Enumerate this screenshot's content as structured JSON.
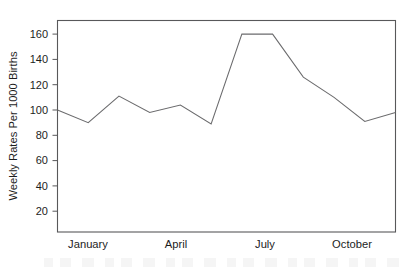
{
  "chart_data": {
    "type": "line",
    "title": "",
    "subtitle": "",
    "xlabel": "",
    "ylabel": "Weekly Rates Per 1000 Births",
    "categories": [
      "January",
      "February",
      "March",
      "April",
      "May",
      "June",
      "July",
      "August",
      "September",
      "October",
      "November",
      "December"
    ],
    "x_tick_labels": [
      "January",
      "April",
      "July",
      "October"
    ],
    "x_tick_categories": [
      "January",
      "April",
      "July",
      "October"
    ],
    "y_tick_labels": [
      "20",
      "40",
      "60",
      "80",
      "100",
      "120",
      "140",
      "160"
    ],
    "y_ticks": [
      20,
      40,
      60,
      80,
      100,
      120,
      140,
      160
    ],
    "ylim": [
      0,
      172
    ],
    "xlim": [
      0,
      11
    ],
    "grid": false,
    "legend": false,
    "legend_position": "none",
    "series": [
      {
        "name": "Weekly Rates Per 1000 Births",
        "color": "#6b6b6d",
        "values": [
          100,
          90,
          111,
          98,
          104,
          89,
          160,
          160,
          126,
          110,
          91,
          98
        ]
      }
    ],
    "annotations": []
  },
  "figure": {
    "axis_color": "#58585a",
    "line_color": "#6b6b6d",
    "text_color": "#1d1d1d",
    "background": "#ffffff"
  }
}
